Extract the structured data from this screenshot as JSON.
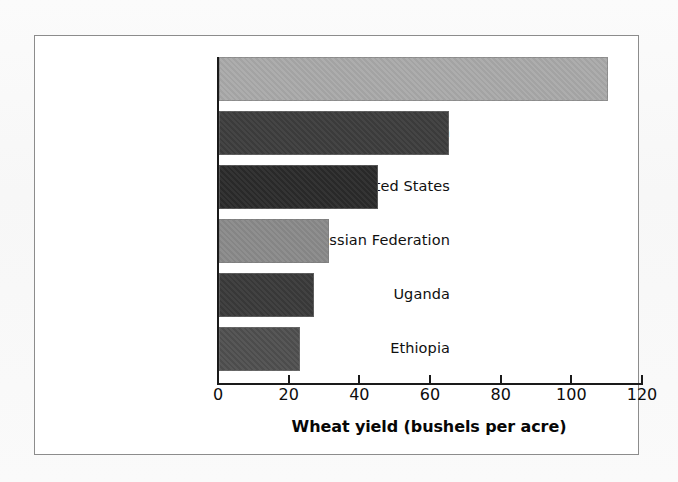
{
  "figure": {
    "frame_border_color": "#8c8c8c",
    "background_color": "#ffffff",
    "axis_color": "#1a1a1a"
  },
  "chart_data": {
    "type": "bar",
    "orientation": "horizontal",
    "title": "",
    "subtitle": "",
    "xlabel": "Wheat yield (bushels per acre)",
    "ylabel": "",
    "xlim": [
      0,
      120
    ],
    "xticks": [
      0,
      20,
      40,
      60,
      80,
      100,
      120
    ],
    "xtick_labels": [
      "0",
      "20",
      "40",
      "60",
      "80",
      "100",
      "120"
    ],
    "grid": false,
    "legend": false,
    "legend_position": "none",
    "categories": [
      "France",
      "Japan",
      "United States",
      "Russian Federation",
      "Uganda",
      "Ethiopia"
    ],
    "values": [
      110,
      65,
      45,
      31,
      27,
      23
    ],
    "bar_colors": [
      "#a9a9a9",
      "#3d3d3d",
      "#2b2b2b",
      "#8a8a8a",
      "#3a3a3a",
      "#4f4f4f"
    ],
    "bars": [
      {
        "category": "France",
        "value": 110,
        "color": "#a9a9a9"
      },
      {
        "category": "Japan",
        "value": 65,
        "color": "#3d3d3d"
      },
      {
        "category": "United States",
        "value": 45,
        "color": "#2b2b2b"
      },
      {
        "category": "Russian Federation",
        "value": 31,
        "color": "#8a8a8a"
      },
      {
        "category": "Uganda",
        "value": 27,
        "color": "#3a3a3a"
      },
      {
        "category": "Ethiopia",
        "value": 23,
        "color": "#4f4f4f"
      }
    ]
  }
}
